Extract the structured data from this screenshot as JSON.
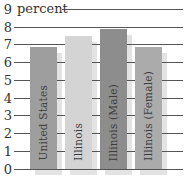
{
  "chart_data": {
    "type": "bar",
    "title": "percent",
    "categories": [
      "United States",
      "Illinois",
      "Illinois (Male)",
      "Illinois (Female)"
    ],
    "values": [
      6.9,
      7.5,
      7.9,
      6.9
    ],
    "xlabel": "",
    "ylabel": "percent",
    "ylim": [
      0,
      9
    ],
    "yticks": [
      0,
      1,
      2,
      3,
      4,
      5,
      6,
      7,
      8,
      9
    ],
    "grid": true,
    "legend_position": "none",
    "bar_colors": [
      "#9e9e9e",
      "#d4d4d4",
      "#8d8d8d",
      "#ababab"
    ],
    "shadow_color": "#e3e3e3",
    "gridline_color": "#555555",
    "text_color": "#333333",
    "bar_label_color": "#3d3d3d",
    "background_color": "#ffffff"
  }
}
